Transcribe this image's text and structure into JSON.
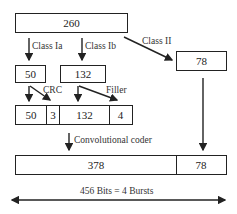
{
  "diagram": {
    "type": "flowchart",
    "top_box": {
      "value": "260"
    },
    "class_labels": {
      "class_ia": "Class Ia",
      "class_ib": "Class Ib",
      "class_ii": "Class II"
    },
    "class_boxes": {
      "class_ia": "50",
      "class_ib": "132",
      "class_ii": "78"
    },
    "annotations": {
      "crc": "CRC",
      "filler": "Filler",
      "coder": "Convolutional coder"
    },
    "coded_row": [
      "50",
      "3",
      "132",
      "4"
    ],
    "output_row": [
      "378",
      "78"
    ],
    "total_label": "456 Bits = 4 Bursts",
    "colors": {
      "line": "#222222",
      "background": "#ffffff"
    }
  }
}
